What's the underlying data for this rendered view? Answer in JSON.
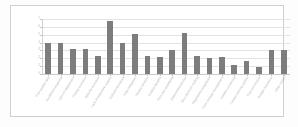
{
  "chart_data": {
    "type": "bar",
    "title": "",
    "subtitle": "",
    "xlabel": "",
    "ylabel": "",
    "ylim": [
      0,
      7
    ],
    "yticks": [
      "0",
      "1",
      "2",
      "3",
      "4",
      "5",
      "6",
      "7"
    ],
    "grid": true,
    "legend": null,
    "orientation": "vertical",
    "bar_color": "#7d7d7d",
    "gridline_color": "#e3e3e3",
    "axis_color": "#c9c9c9",
    "label_color": "#b5b5b5",
    "background_color": "#ffffff",
    "note": "Category labels are rendered at sub-pixel size in the source image and are not legible; they are recorded as blurred placeholder glyphs matching the visible stroke pattern.",
    "categories": [
      "Poor quality data",
      "Insufficient expertise",
      "Cost of deployment",
      "Privacy concerns",
      "Security concerns",
      "Lack of executive support",
      "Cultural resistance",
      "Data integration",
      "Legacy systems",
      "Unclear benefits",
      "Poor tool availability",
      "Organisational silos",
      "Slow decision making",
      "Regulatory compliance",
      "Poor change management",
      "Unclear ownership",
      "Limited training options",
      "Time constraints",
      "Budget limitations",
      "Other issues"
    ],
    "values": [
      4.0,
      4.0,
      3.2,
      3.2,
      2.3,
      6.8,
      4.0,
      5.1,
      2.3,
      2.2,
      3.1,
      5.2,
      2.3,
      2.0,
      2.2,
      1.1,
      1.6,
      0.9,
      3.0,
      3.0
    ]
  }
}
